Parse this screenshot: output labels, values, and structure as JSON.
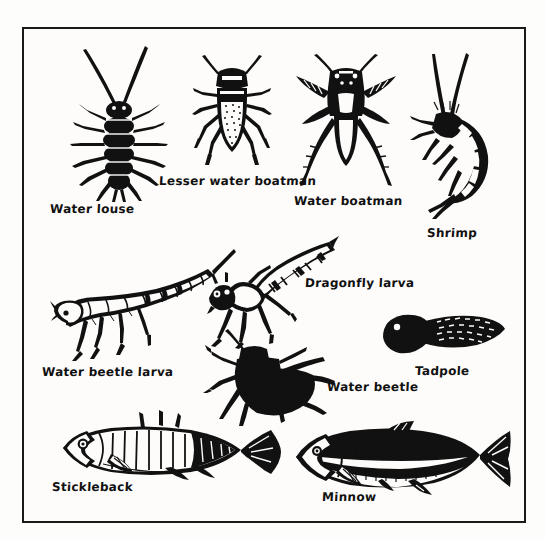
{
  "page": {
    "background_color": "#fdfdfb",
    "frame_color": "#1a1a1a",
    "ink_color": "#111111",
    "style": "black and white line drawing / hand-lettered labels"
  },
  "specimens": [
    {
      "id": "water-louse",
      "label": "Water louse",
      "label_x": 48,
      "label_y": 200,
      "art_x": 55,
      "art_y": 40,
      "art_w": 120,
      "art_h": 160,
      "description": "dark segmented isopod with many legs and two long antennae, viewed from above"
    },
    {
      "id": "lesser-water-boatman",
      "label": "Lesser water boatman",
      "label_x": 157,
      "label_y": 172,
      "art_x": 182,
      "art_y": 50,
      "art_w": 96,
      "art_h": 114,
      "description": "elongated oval speckled body with six legs and short antennae, viewed from above"
    },
    {
      "id": "water-boatman",
      "label": "Water boatman",
      "label_x": 292,
      "label_y": 192,
      "art_x": 292,
      "art_y": 52,
      "art_w": 104,
      "art_h": 130,
      "description": "dark bodied bug with large feathered oar-like swimming legs, viewed from above"
    },
    {
      "id": "shrimp",
      "label": "Shrimp",
      "label_x": 425,
      "label_y": 224,
      "art_x": 404,
      "art_y": 50,
      "art_w": 110,
      "art_h": 165,
      "description": "C-curved segmented freshwater shrimp with two long antennae and many legs"
    },
    {
      "id": "water-beetle-larva",
      "label": "Water beetle larva",
      "label_x": 40,
      "label_y": 363,
      "art_x": 50,
      "art_y": 243,
      "art_w": 180,
      "art_h": 118,
      "description": "long segmented larva with tapering tail, pointed head and six legs"
    },
    {
      "id": "dragonfly-larva",
      "label": "Dragonfly larva",
      "label_x": 303,
      "label_y": 274,
      "art_x": 205,
      "art_y": 232,
      "art_w": 130,
      "art_h": 110,
      "description": "stout segmented nymph with large head, six legs and banded abdomen"
    },
    {
      "id": "water-beetle",
      "label": "Water beetle",
      "label_x": 325,
      "label_y": 378,
      "art_x": 205,
      "art_y": 325,
      "art_w": 125,
      "art_h": 95,
      "description": "solid black oval beetle with broad wing cases and long legs, viewed from above"
    },
    {
      "id": "tadpole",
      "label": "Tadpole",
      "label_x": 413,
      "label_y": 362,
      "art_x": 375,
      "art_y": 305,
      "art_w": 125,
      "art_h": 55,
      "description": "dark rounded head with speckled tapering tail"
    },
    {
      "id": "stickleback",
      "label": "Stickleback",
      "label_x": 50,
      "label_y": 478,
      "art_x": 55,
      "art_y": 408,
      "art_w": 225,
      "art_h": 80,
      "description": "small fish with dorsal spines, banded flank and fan tail"
    },
    {
      "id": "minnow",
      "label": "Minnow",
      "label_x": 320,
      "label_y": 488,
      "art_x": 290,
      "art_y": 415,
      "art_w": 220,
      "art_h": 85,
      "description": "streamlined dark-backed fish with pale belly and forked tail"
    }
  ]
}
